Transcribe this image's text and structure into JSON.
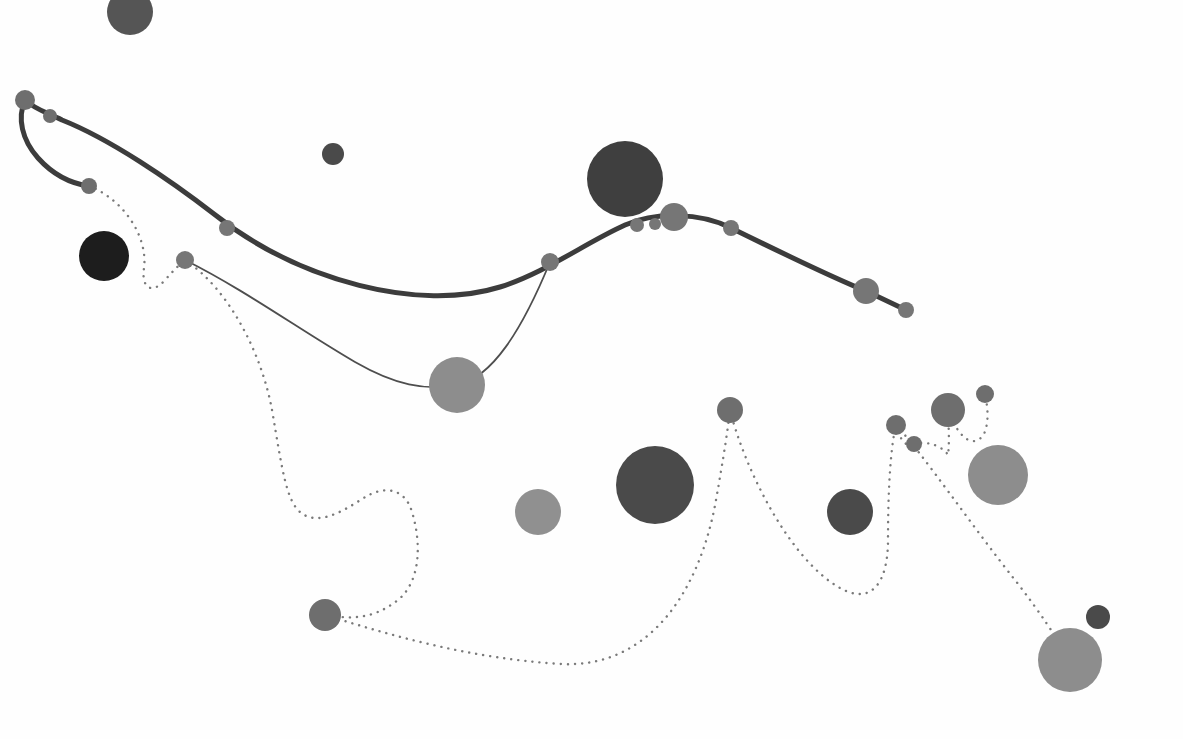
{
  "canvas": {
    "width": 1183,
    "height": 739,
    "background": "#fefefe",
    "title": "Network Node Diagram"
  },
  "palette": {
    "near_black": "#1d1d1d",
    "very_dark_gray": "#3f3f3f",
    "dark_gray": "#4a4a4a",
    "mid_dark_gray": "#555555",
    "mid_gray": "#6e6e6e",
    "gray": "#767676",
    "light_gray": "#8d8d8d",
    "lighter_gray": "#909090",
    "edge_thick": "#3c3c3c",
    "edge_thin": "#4e4e4e",
    "edge_dotted": "#7a7a7a"
  },
  "chart_data": {
    "type": "scatter",
    "title": "Network Node Diagram",
    "xlabel": "",
    "ylabel": "",
    "xlim": [
      0,
      1183
    ],
    "ylim": [
      0,
      739
    ],
    "grid": false,
    "legend": "none",
    "nodes": [
      {
        "id": "n1",
        "label": "root-left",
        "x": 25,
        "y": 100,
        "r": 10,
        "color": "#6e6e6e",
        "on_path": "thick-chain"
      },
      {
        "id": "n2",
        "label": "root-left-adjacent",
        "x": 50,
        "y": 116,
        "r": 7,
        "color": "#6e6e6e",
        "on_path": "thick-chain"
      },
      {
        "id": "n3",
        "label": "left-branch-tip",
        "x": 89,
        "y": 186,
        "r": 8,
        "color": "#6e6e6e",
        "on_path": "thick-chain"
      },
      {
        "id": "n4",
        "label": "upper-left-dark",
        "x": 130,
        "y": 12,
        "r": 23,
        "color": "#555555",
        "on_path": "none"
      },
      {
        "id": "n5",
        "label": "left-near-black",
        "x": 104,
        "y": 256,
        "r": 25,
        "color": "#1d1d1d",
        "on_path": "none"
      },
      {
        "id": "n6",
        "label": "thin-branch-origin",
        "x": 185,
        "y": 260,
        "r": 9,
        "color": "#767676",
        "on_path": "thin-branch"
      },
      {
        "id": "n7",
        "label": "chain-mid-left",
        "x": 227,
        "y": 228,
        "r": 8,
        "color": "#767676",
        "on_path": "thick-chain"
      },
      {
        "id": "n8",
        "label": "small-top-mid",
        "x": 333,
        "y": 154,
        "r": 11,
        "color": "#4a4a4a",
        "on_path": "none"
      },
      {
        "id": "n9",
        "label": "large-light-mid",
        "x": 457,
        "y": 385,
        "r": 28,
        "color": "#8d8d8d",
        "on_path": "thin-branch"
      },
      {
        "id": "n10",
        "label": "chain-valley",
        "x": 550,
        "y": 262,
        "r": 9,
        "color": "#767676",
        "on_path": "thick-chain"
      },
      {
        "id": "n11",
        "label": "big-dark-upper",
        "x": 625,
        "y": 179,
        "r": 38,
        "color": "#3f3f3f",
        "on_path": "none"
      },
      {
        "id": "n12",
        "label": "chain-peak-small-a",
        "x": 637,
        "y": 225,
        "r": 7,
        "color": "#767676",
        "on_path": "thick-chain"
      },
      {
        "id": "n13",
        "label": "chain-peak-small-b",
        "x": 655,
        "y": 224,
        "r": 6,
        "color": "#767676",
        "on_path": "thick-chain"
      },
      {
        "id": "n14",
        "label": "chain-peak-large",
        "x": 674,
        "y": 217,
        "r": 14,
        "color": "#767676",
        "on_path": "thick-chain"
      },
      {
        "id": "n15",
        "label": "chain-after-peak",
        "x": 731,
        "y": 228,
        "r": 8,
        "color": "#767676",
        "on_path": "thick-chain"
      },
      {
        "id": "n16",
        "label": "chain-right-hub",
        "x": 866,
        "y": 291,
        "r": 13,
        "color": "#767676",
        "on_path": "thick-chain"
      },
      {
        "id": "n17",
        "label": "chain-right-tip",
        "x": 906,
        "y": 310,
        "r": 8,
        "color": "#767676",
        "on_path": "thick-chain"
      },
      {
        "id": "n18",
        "label": "dotted-hub-lower-mid",
        "x": 730,
        "y": 410,
        "r": 13,
        "color": "#6e6e6e",
        "on_path": "dotted"
      },
      {
        "id": "n19",
        "label": "big-dark-lower",
        "x": 655,
        "y": 485,
        "r": 39,
        "color": "#4a4a4a",
        "on_path": "none"
      },
      {
        "id": "n20",
        "label": "light-lower-mid",
        "x": 538,
        "y": 512,
        "r": 23,
        "color": "#909090",
        "on_path": "none"
      },
      {
        "id": "n21",
        "label": "mid-dark-lower-right",
        "x": 850,
        "y": 512,
        "r": 23,
        "color": "#4a4a4a",
        "on_path": "none"
      },
      {
        "id": "n22",
        "label": "dotted-node-left-bot",
        "x": 325,
        "y": 615,
        "r": 16,
        "color": "#6e6e6e",
        "on_path": "dotted"
      },
      {
        "id": "n23",
        "label": "cluster-left-small",
        "x": 896,
        "y": 425,
        "r": 10,
        "color": "#6e6e6e",
        "on_path": "dotted"
      },
      {
        "id": "n24",
        "label": "cluster-tiny",
        "x": 914,
        "y": 444,
        "r": 8,
        "color": "#6e6e6e",
        "on_path": "dotted"
      },
      {
        "id": "n25",
        "label": "cluster-center",
        "x": 948,
        "y": 410,
        "r": 17,
        "color": "#6e6e6e",
        "on_path": "dotted"
      },
      {
        "id": "n26",
        "label": "cluster-top-tiny",
        "x": 985,
        "y": 394,
        "r": 9,
        "color": "#6e6e6e",
        "on_path": "dotted"
      },
      {
        "id": "n27",
        "label": "large-light-right",
        "x": 998,
        "y": 475,
        "r": 30,
        "color": "#8d8d8d",
        "on_path": "none"
      },
      {
        "id": "n28",
        "label": "large-light-bottom",
        "x": 1070,
        "y": 660,
        "r": 32,
        "color": "#8d8d8d",
        "on_path": "dotted"
      },
      {
        "id": "n29",
        "label": "small-dark-bottom",
        "x": 1098,
        "y": 617,
        "r": 12,
        "color": "#4a4a4a",
        "on_path": "none"
      }
    ],
    "edges": [
      {
        "id": "e1",
        "style": "solid-thick",
        "width": 5,
        "color": "#3c3c3c",
        "from": "n1",
        "to": "n3",
        "label": "left-descending-branch"
      },
      {
        "id": "e2",
        "style": "solid-thick",
        "width": 5,
        "color": "#3c3c3c",
        "from": "n1",
        "to": "n17",
        "label": "main-chain-spline"
      },
      {
        "id": "e3",
        "style": "solid-thin",
        "width": 1.8,
        "color": "#4e4e4e",
        "from": "n6",
        "to": "n10",
        "label": "thin-secondary-branch"
      },
      {
        "id": "e4",
        "style": "dotted",
        "width": 2.4,
        "color": "#7a7a7a",
        "from": "n3",
        "to": "n6",
        "label": "dotted-left-loop"
      },
      {
        "id": "e5",
        "style": "dotted",
        "width": 2.4,
        "color": "#7a7a7a",
        "from": "n6",
        "to": "n22",
        "label": "dotted-long-descent"
      },
      {
        "id": "e6",
        "style": "dotted",
        "width": 2.4,
        "color": "#7a7a7a",
        "from": "n22",
        "to": "n18",
        "label": "dotted-bottom-sweep"
      },
      {
        "id": "e7",
        "style": "dotted",
        "width": 2.4,
        "color": "#7a7a7a",
        "from": "n18",
        "to": "n23",
        "label": "dotted-right-rise"
      },
      {
        "id": "e8",
        "style": "dotted",
        "width": 2.4,
        "color": "#7a7a7a",
        "from": "n23",
        "to": "n24",
        "label": "dotted-cluster-hook"
      },
      {
        "id": "e9",
        "style": "dotted",
        "width": 2.4,
        "color": "#7a7a7a",
        "from": "n24",
        "to": "n25",
        "label": "dotted-cluster-link"
      },
      {
        "id": "e10",
        "style": "dotted",
        "width": 2.4,
        "color": "#7a7a7a",
        "from": "n25",
        "to": "n26",
        "label": "dotted-cluster-top"
      },
      {
        "id": "e11",
        "style": "dotted",
        "width": 2.4,
        "color": "#7a7a7a",
        "from": "n23",
        "to": "n28",
        "label": "dotted-long-right-descent"
      }
    ],
    "node_count": 29,
    "edge_count": 11,
    "radius_range": [
      6,
      39
    ],
    "color_levels": [
      "#1d1d1d",
      "#3f3f3f",
      "#4a4a4a",
      "#555555",
      "#6e6e6e",
      "#767676",
      "#8d8d8d",
      "#909090"
    ]
  },
  "paths": {
    "main_chain": "M 25 100 C 36 110 46 112 62 120 C 110 139 170 180 214 214 C 300 282 420 312 500 287 C 545 273 585 243 625 225 C 655 212 700 212 731 228 C 790 257 836 279 866 291",
    "left_branch": "M 25 100 C 17 118 22 140 38 158 C 56 178 74 184 89 186",
    "chain_tail": "M 866 291 L 906 310",
    "thin_branch": "M 185 260 C 245 290 300 330 355 362 C 395 385 425 391 457 385 C 492 378 522 330 550 262",
    "dotted_left_loop": "M 89 186 C 125 200 148 238 144 268 C 141 288 152 295 165 280 C 174 270 180 264 185 260",
    "dotted_long_descent": "M 185 260 C 230 290 262 355 272 410 C 282 468 286 500 300 512 C 320 529 350 506 367 496 C 385 486 405 488 412 512 C 422 545 420 582 398 600 C 370 622 345 618 325 615",
    "dotted_bottom_sweep": "M 325 615 C 400 638 470 658 560 664 C 650 669 700 590 716 500 C 724 455 728 428 730 410",
    "dotted_right_rise": "M 730 410 C 745 470 790 560 840 588 C 872 606 888 582 888 540 C 888 495 890 450 896 425",
    "dotted_cluster_hook": "M 896 425 C 900 440 906 448 914 444",
    "dotted_cluster_link": "M 914 444 C 930 440 944 448 948 455 C 950 440 948 420 948 410",
    "dotted_cluster_top": "M 948 410 C 960 442 975 448 984 434 C 990 420 987 404 985 394",
    "dotted_long_right_descent": "M 896 425 C 920 450 975 530 1015 580 C 1040 612 1058 640 1070 660"
  },
  "meta": {
    "node_shape": "circle",
    "line_cap": "round",
    "dotted_dash_array": "0.1 7"
  }
}
